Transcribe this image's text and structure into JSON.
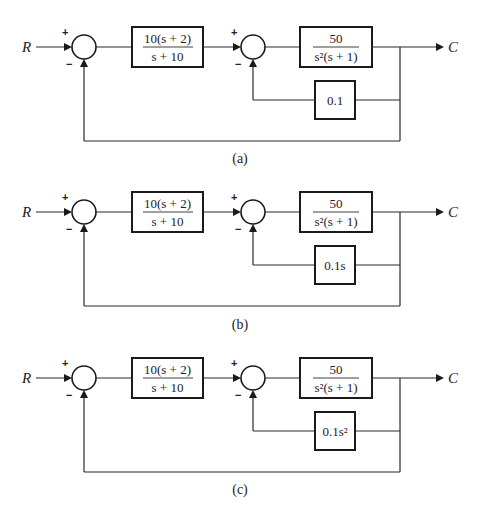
{
  "diagrams": [
    {
      "caption": "(a)",
      "input_label": "R",
      "output_label": "C",
      "sum1_signs": {
        "top": "+",
        "bottom": "−"
      },
      "sum2_signs": {
        "top": "+",
        "bottom": "−"
      },
      "forward_block_1": {
        "numerator": "10(s + 2)",
        "denominator": "s + 10"
      },
      "forward_block_2": {
        "numerator": "50",
        "denominator": "s²(s + 1)"
      },
      "feedback_block": "0.1"
    },
    {
      "caption": "(b)",
      "input_label": "R",
      "output_label": "C",
      "sum1_signs": {
        "top": "+",
        "bottom": "−"
      },
      "sum2_signs": {
        "top": "+",
        "bottom": "−"
      },
      "forward_block_1": {
        "numerator": "10(s + 2)",
        "denominator": "s + 10"
      },
      "forward_block_2": {
        "numerator": "50",
        "denominator": "s²(s + 1)"
      },
      "feedback_block": "0.1s"
    },
    {
      "caption": "(c)",
      "input_label": "R",
      "output_label": "C",
      "sum1_signs": {
        "top": "+",
        "bottom": "−"
      },
      "sum2_signs": {
        "top": "+",
        "bottom": "−"
      },
      "forward_block_1": {
        "numerator": "10(s + 2)",
        "denominator": "s + 10"
      },
      "forward_block_2": {
        "numerator": "50",
        "denominator": "s²(s + 1)"
      },
      "feedback_block": "0.1s²"
    }
  ]
}
